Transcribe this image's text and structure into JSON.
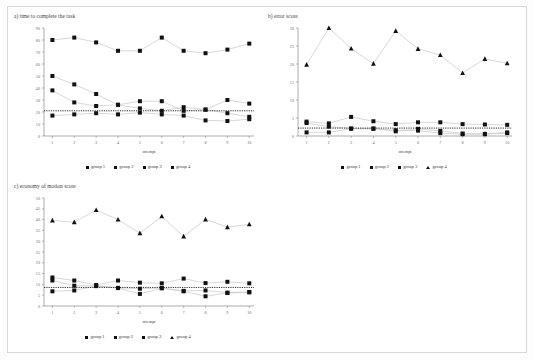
{
  "page": {
    "background": "#ffffff",
    "frame_color": "#d8d8d8"
  },
  "legend": {
    "items": [
      {
        "label": "group 1",
        "marker": "square"
      },
      {
        "label": "group 2",
        "marker": "square"
      },
      {
        "label": "group 3",
        "marker": "square"
      },
      {
        "label": "group 4",
        "marker": "square"
      }
    ],
    "items_tri": [
      {
        "label": "group 1",
        "marker": "square"
      },
      {
        "label": "group 2",
        "marker": "square"
      },
      {
        "label": "group 3",
        "marker": "square"
      },
      {
        "label": "group 4",
        "marker": "triangle"
      }
    ]
  },
  "chart_data": [
    {
      "id": "a",
      "type": "line",
      "title": "a) time to complete the task",
      "xlabel": "attempt",
      "ylabel": "",
      "x": [
        1,
        2,
        3,
        4,
        5,
        6,
        7,
        8,
        9,
        10
      ],
      "xtick_labels": [
        "1",
        "2",
        "3",
        "4",
        "5",
        "6",
        "7",
        "8",
        "9",
        "10"
      ],
      "ylim": [
        0,
        90
      ],
      "ytick_labels": [
        "0",
        "10",
        "20",
        "30",
        "40",
        "50",
        "60",
        "70",
        "80",
        "90"
      ],
      "ystep": 10,
      "grid": false,
      "legend_position": "bottom",
      "marker_color": "#111111",
      "line_color": "#bdbdbd",
      "trend_line": {
        "value": 21,
        "style": "dotted",
        "color": "#111111"
      },
      "series": [
        {
          "name": "group 1",
          "marker": "square",
          "values": [
            17,
            18,
            19,
            18,
            19.5,
            18,
            17,
            13,
            12.5,
            14
          ]
        },
        {
          "name": "group 2",
          "marker": "square",
          "values": [
            38,
            28,
            25,
            26,
            23,
            21,
            24,
            22,
            19,
            16
          ]
        },
        {
          "name": "group 3",
          "marker": "square",
          "values": [
            50,
            43,
            35,
            26,
            29,
            29,
            21,
            22,
            30,
            27
          ]
        },
        {
          "name": "group 4",
          "marker": "square",
          "values": [
            80,
            82,
            78,
            71,
            71,
            82,
            71,
            69,
            72,
            77
          ]
        }
      ]
    },
    {
      "id": "b",
      "type": "line",
      "title": "b) error score",
      "xlabel": "attempt",
      "ylabel": "",
      "x": [
        1,
        2,
        3,
        4,
        5,
        6,
        7,
        8,
        9,
        10
      ],
      "xtick_labels": [
        "1",
        "2",
        "3",
        "4",
        "5",
        "6",
        "7",
        "8",
        "9",
        "10"
      ],
      "ylim": [
        0,
        30
      ],
      "ytick_labels": [
        "0",
        "5",
        "10",
        "15",
        "20",
        "25",
        "30"
      ],
      "ystep": 5,
      "grid": false,
      "legend_position": "bottom",
      "marker_color": "#111111",
      "line_color": "#bdbdbd",
      "trend_line": {
        "value": 2.2,
        "style": "dotted",
        "color": "#111111"
      },
      "series": [
        {
          "name": "group 1",
          "marker": "square",
          "values": [
            1.0,
            1.0,
            2.0,
            2.0,
            1.6,
            1.5,
            0.8,
            0.5,
            0.5,
            0.8
          ]
        },
        {
          "name": "group 2",
          "marker": "square",
          "values": [
            3.6,
            2.6,
            2.1,
            2.1,
            1.3,
            2.0,
            1.4,
            0.7,
            0.6,
            1.0
          ]
        },
        {
          "name": "group 3",
          "marker": "square",
          "values": [
            4.0,
            3.5,
            5.3,
            4.1,
            3.3,
            3.8,
            3.8,
            3.3,
            3.2,
            3.1
          ]
        },
        {
          "name": "group 4",
          "marker": "triangle",
          "values": [
            19.8,
            30.0,
            24.3,
            20.1,
            29.2,
            24.2,
            22.5,
            17.5,
            21.4,
            20.2
          ]
        }
      ]
    },
    {
      "id": "c",
      "type": "line",
      "title": "c) economy of motion score",
      "xlabel": "attempt",
      "ylabel": "",
      "x": [
        1,
        2,
        3,
        4,
        5,
        6,
        7,
        8,
        9,
        10
      ],
      "xtick_labels": [
        "1",
        "2",
        "3",
        "4",
        "5",
        "6",
        "7",
        "8",
        "9",
        "10"
      ],
      "ylim": [
        0,
        50
      ],
      "ytick_labels": [
        "0",
        "5",
        "10",
        "15",
        "20",
        "25",
        "30",
        "35",
        "40",
        "45",
        "50"
      ],
      "ystep": 5,
      "grid": false,
      "legend_position": "bottom",
      "marker_color": "#111111",
      "line_color": "#bdbdbd",
      "trend_line": {
        "value": 8.6,
        "style": "dotted",
        "color": "#111111"
      },
      "series": [
        {
          "name": "group 1",
          "marker": "square",
          "values": [
            6.8,
            7.2,
            9.2,
            8.4,
            8.0,
            8.3,
            7.0,
            7.2,
            6.2,
            6.5
          ]
        },
        {
          "name": "group 2",
          "marker": "square",
          "values": [
            11.8,
            9.4,
            9.4,
            8.3,
            5.6,
            8.2,
            6.8,
            4.5,
            6.0,
            6.3
          ]
        },
        {
          "name": "group 3",
          "marker": "square",
          "values": [
            13.2,
            11.8,
            9.7,
            11.8,
            10.8,
            10.5,
            12.7,
            10.6,
            11.2,
            10.5
          ]
        },
        {
          "name": "group 4",
          "marker": "triangle",
          "values": [
            39.6,
            38.8,
            44.4,
            40.0,
            33.7,
            41.5,
            32.2,
            40.1,
            36.5,
            37.8
          ]
        }
      ]
    }
  ]
}
